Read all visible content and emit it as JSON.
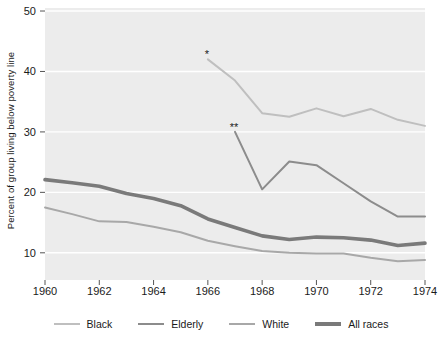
{
  "chart_data": {
    "type": "line",
    "title": "",
    "xlabel": "",
    "ylabel": "Percent of group living below poverty line",
    "xlim": [
      1960,
      1974
    ],
    "ylim": [
      5.5,
      50.5
    ],
    "xticks": [
      1960,
      1962,
      1964,
      1966,
      1968,
      1970,
      1972,
      1974
    ],
    "yticks": [
      10,
      20,
      30,
      40,
      50
    ],
    "grid": "horizontal-white",
    "legend_position": "bottom",
    "background": "#ececec",
    "series": [
      {
        "name": "Black",
        "color": "#bfbfbf",
        "width": 2.0,
        "marker": "*",
        "marker_label": "*",
        "x": [
          1966,
          1967,
          1968,
          1969,
          1970,
          1971,
          1972,
          1973,
          1974
        ],
        "values": [
          42.0,
          38.5,
          33.1,
          32.5,
          33.9,
          32.6,
          33.8,
          32.0,
          31.0
        ]
      },
      {
        "name": "Elderly",
        "color": "#8c8c8c",
        "width": 2.0,
        "marker": "**",
        "marker_label": "**",
        "x": [
          1967,
          1968,
          1969,
          1970,
          1971,
          1972,
          1973,
          1974
        ],
        "values": [
          30.0,
          20.5,
          25.1,
          24.5,
          21.5,
          18.5,
          16.0,
          16.0
        ]
      },
      {
        "name": "White",
        "color": "#a8a8a8",
        "width": 2.0,
        "marker": "",
        "marker_label": "",
        "x": [
          1960,
          1961,
          1962,
          1963,
          1964,
          1965,
          1966,
          1967,
          1968,
          1969,
          1970,
          1971,
          1972,
          1973,
          1974
        ],
        "values": [
          17.5,
          16.4,
          15.2,
          15.1,
          14.3,
          13.4,
          12.0,
          11.1,
          10.3,
          10.0,
          9.9,
          9.9,
          9.2,
          8.6,
          8.8
        ]
      },
      {
        "name": "All races",
        "color": "#7a7a7a",
        "width": 3.6,
        "marker": "",
        "marker_label": "",
        "x": [
          1960,
          1961,
          1962,
          1963,
          1964,
          1965,
          1966,
          1967,
          1968,
          1969,
          1970,
          1971,
          1972,
          1973,
          1974
        ],
        "values": [
          22.1,
          21.6,
          21.0,
          19.8,
          19.0,
          17.8,
          15.6,
          14.2,
          12.8,
          12.2,
          12.6,
          12.5,
          12.1,
          11.2,
          11.6
        ]
      }
    ]
  },
  "axis": {
    "y_title": "Percent of group living below poverty line",
    "y_tick_labels": [
      "50",
      "40",
      "30",
      "20",
      "10"
    ],
    "x_tick_labels": [
      "1960",
      "1962",
      "1964",
      "1966",
      "1968",
      "1970",
      "1972",
      "1974"
    ]
  },
  "legend": {
    "items": [
      {
        "label": "Black",
        "color": "#bfbfbf",
        "thickness": "2px"
      },
      {
        "label": "Elderly",
        "color": "#8c8c8c",
        "thickness": "2px"
      },
      {
        "label": "White",
        "color": "#a8a8a8",
        "thickness": "2px"
      },
      {
        "label": "All races",
        "color": "#7a7a7a",
        "thickness": "4px"
      }
    ]
  },
  "annotations": [
    {
      "name": "black-start-marker",
      "text": "*",
      "series": "Black",
      "x": 1966,
      "y": 42.0
    },
    {
      "name": "elderly-start-marker",
      "text": "**",
      "series": "Elderly",
      "x": 1967,
      "y": 30.0
    }
  ],
  "colors": {
    "plot_background": "#ececec",
    "gridline": "#ffffff",
    "text": "#1a1a1a",
    "tick": "#555555"
  }
}
